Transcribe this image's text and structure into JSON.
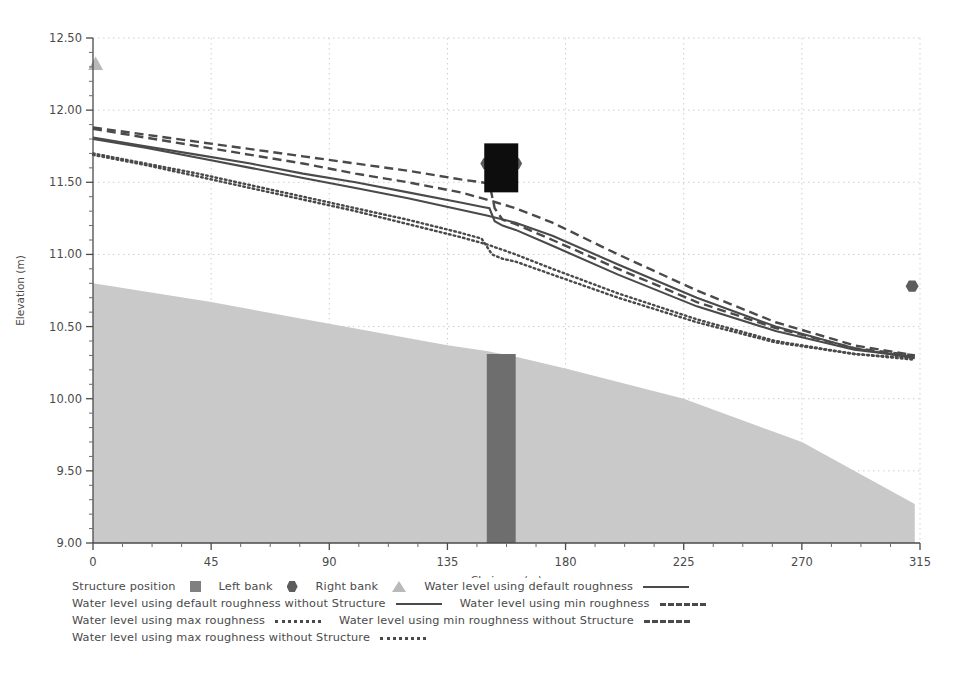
{
  "chart_data": {
    "type": "line",
    "title": "",
    "xlabel": "Chainage (m)",
    "ylabel": "Elevation (m)",
    "xlim": [
      0,
      315
    ],
    "ylim": [
      9.0,
      12.5
    ],
    "xticks": [
      0,
      45,
      90,
      135,
      180,
      225,
      270,
      315
    ],
    "yticks": [
      "9.00",
      "9.50",
      "10.00",
      "10.50",
      "11.00",
      "11.50",
      "12.00",
      "12.50"
    ],
    "xtick_labels": [
      "0",
      "45",
      "90",
      "135",
      "180",
      "225",
      "270",
      "315"
    ],
    "minor_tick_count_x": 3,
    "minor_tick_count_y": 4,
    "grid": true,
    "grid_style": "dotted",
    "grid_color": "#cfcfcf",
    "legend_position": "below",
    "structure_chainage": [
      150.0,
      161.0
    ],
    "series": [
      {
        "name": "Water level using default roughness",
        "style": "solid",
        "color": "#4a4a4a",
        "x": [
          0,
          20,
          40,
          60,
          80,
          100,
          120,
          140,
          148,
          151,
          153,
          156,
          161,
          175,
          200,
          230,
          260,
          290,
          313
        ],
        "y": [
          11.81,
          11.75,
          11.69,
          11.63,
          11.56,
          11.5,
          11.43,
          11.36,
          11.33,
          11.32,
          11.23,
          11.2,
          11.17,
          11.06,
          10.86,
          10.64,
          10.47,
          10.34,
          10.29
        ]
      },
      {
        "name": "Water level using default roughness without Structure",
        "style": "solid",
        "color": "#4a4a4a",
        "x": [
          0,
          20,
          40,
          60,
          80,
          100,
          120,
          140,
          150,
          161,
          175,
          200,
          230,
          260,
          290,
          313
        ],
        "y": [
          11.8,
          11.74,
          11.67,
          11.6,
          11.53,
          11.46,
          11.39,
          11.31,
          11.27,
          11.22,
          11.13,
          10.93,
          10.7,
          10.5,
          10.35,
          10.28
        ]
      },
      {
        "name": "Water level using min roughness",
        "style": "dashed",
        "color": "#4a4a4a",
        "x": [
          0,
          20,
          40,
          60,
          80,
          100,
          120,
          140,
          148,
          151,
          153,
          156,
          161,
          175,
          200,
          230,
          260,
          290,
          313
        ],
        "y": [
          11.88,
          11.83,
          11.78,
          11.73,
          11.68,
          11.63,
          11.58,
          11.52,
          11.5,
          11.49,
          11.32,
          11.24,
          11.21,
          11.1,
          10.9,
          10.67,
          10.49,
          10.35,
          10.3
        ]
      },
      {
        "name": "Water level using min roughness without Structure",
        "style": "dashed",
        "color": "#4a4a4a",
        "x": [
          0,
          20,
          40,
          60,
          80,
          100,
          120,
          140,
          150,
          161,
          175,
          200,
          230,
          260,
          290,
          313
        ],
        "y": [
          11.87,
          11.81,
          11.75,
          11.69,
          11.63,
          11.56,
          11.5,
          11.43,
          11.38,
          11.32,
          11.22,
          11.0,
          10.75,
          10.53,
          10.37,
          10.3
        ]
      },
      {
        "name": "Water level using max roughness",
        "style": "dotted",
        "color": "#4a4a4a",
        "x": [
          0,
          20,
          40,
          60,
          80,
          100,
          120,
          140,
          148,
          152,
          156,
          161,
          175,
          200,
          230,
          260,
          290,
          313
        ],
        "y": [
          11.7,
          11.63,
          11.56,
          11.48,
          11.4,
          11.32,
          11.24,
          11.15,
          11.11,
          11.0,
          10.97,
          10.95,
          10.86,
          10.7,
          10.53,
          10.39,
          10.31,
          10.28
        ]
      },
      {
        "name": "Water level using max roughness without Structure",
        "style": "dotted",
        "color": "#4a4a4a",
        "x": [
          0,
          20,
          40,
          60,
          80,
          100,
          120,
          140,
          150,
          161,
          175,
          200,
          230,
          260,
          290,
          313
        ],
        "y": [
          11.69,
          11.62,
          11.54,
          11.46,
          11.38,
          11.3,
          11.21,
          11.12,
          11.07,
          11.0,
          10.9,
          10.73,
          10.55,
          10.4,
          10.31,
          10.27
        ]
      }
    ],
    "terrain": {
      "name": "Ground / bed profile",
      "fill_color": "#c9c9c9",
      "x": [
        0,
        45,
        90,
        135,
        150,
        161,
        180,
        225,
        270,
        313
      ],
      "y": [
        10.8,
        10.67,
        10.52,
        10.37,
        10.33,
        10.29,
        10.21,
        10.0,
        9.7,
        9.27
      ]
    },
    "structure_column": {
      "name": "Structure position",
      "fill_color": "#6e6e6e",
      "x_start": 150.0,
      "x_end": 161.0,
      "y_top": 10.31,
      "y_bottom": 9.0
    },
    "structure_marker": {
      "name": "Structure position marker",
      "fill_color": "#0d0d0d",
      "x_center": 155.5,
      "y_center": 11.6,
      "width_px": 34,
      "height_px": 49
    },
    "markers": [
      {
        "name": "Left bank",
        "shape": "hexagon",
        "color": "#5d5d5d",
        "points": [
          {
            "x": 150.0,
            "y": 11.63
          },
          {
            "x": 161.0,
            "y": 11.63
          },
          {
            "x": 312.0,
            "y": 10.78
          }
        ]
      },
      {
        "name": "Right bank",
        "shape": "triangle",
        "color": "#b9b9b9",
        "points": [
          {
            "x": 1.0,
            "y": 12.32
          }
        ]
      }
    ]
  },
  "legend": {
    "rows": [
      [
        {
          "label": "Structure position",
          "key": "square"
        },
        {
          "label": "Left bank",
          "key": "hexagon"
        },
        {
          "label": "Right bank",
          "key": "triangle"
        },
        {
          "label": "Water level using default roughness",
          "key": "solid"
        }
      ],
      [
        {
          "label": "Water level using default roughness without Structure",
          "key": "solid"
        },
        {
          "label": "Water level using min roughness",
          "key": "dashed"
        }
      ],
      [
        {
          "label": "Water level using max roughness",
          "key": "dotted"
        },
        {
          "label": "Water level using min roughness without Structure",
          "key": "dashed"
        }
      ],
      [
        {
          "label": "Water level using max roughness without Structure",
          "key": "dotted"
        }
      ]
    ]
  },
  "axes": {
    "x_title": "Chainage (m)",
    "y_title": "Elevation (m)"
  }
}
